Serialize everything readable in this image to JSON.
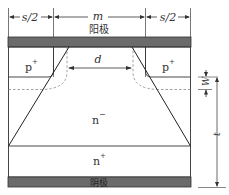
{
  "diagram": {
    "type": "semiconductor cross-section (MPS / JBS diode structure)",
    "dimensions": {
      "left_spacing": "s/2",
      "middle_width": "m",
      "right_spacing": "s/2",
      "gap": "d",
      "depletion_width": "W",
      "thickness": "t"
    },
    "electrodes": {
      "top": "阳极",
      "bottom": "阴极"
    },
    "regions": {
      "left_p": "p",
      "right_p": "p",
      "p_superscript": "+",
      "drift": "n",
      "drift_superscript": "−",
      "substrate": "n",
      "substrate_superscript": "+"
    },
    "colors": {
      "metal": "#6b6b6b",
      "line": "#333333",
      "dashed": "#888888"
    }
  }
}
